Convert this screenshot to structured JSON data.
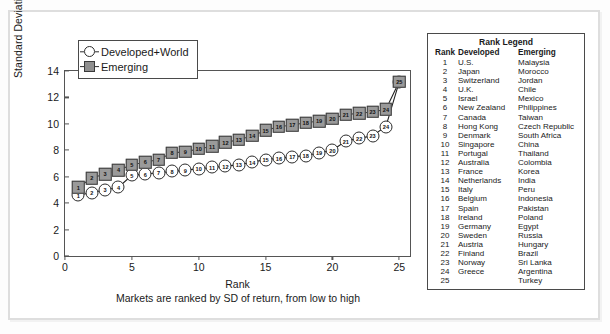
{
  "chart_data": {
    "type": "line",
    "title": "",
    "xlabel": "Rank",
    "xsublabel": "Markets are ranked by SD of return, from low to high",
    "ylabel": "Standard Deviation (%/month)",
    "xlim": [
      0,
      25.8
    ],
    "ylim": [
      0,
      14
    ],
    "yticks": [
      0,
      2,
      4,
      6,
      8,
      10,
      12,
      14
    ],
    "xticks": [
      0,
      5,
      10,
      15,
      20,
      25
    ],
    "grid": false,
    "legend_position": "top-left",
    "x": [
      1,
      2,
      3,
      4,
      5,
      6,
      7,
      8,
      9,
      10,
      11,
      12,
      13,
      14,
      15,
      16,
      17,
      18,
      19,
      20,
      21,
      22,
      23,
      24,
      25
    ],
    "series": [
      {
        "name": "Developed+World",
        "marker": "open-circle",
        "values": [
          4.6,
          4.8,
          5.0,
          5.2,
          6.1,
          6.2,
          6.3,
          6.4,
          6.5,
          6.6,
          6.7,
          6.8,
          6.9,
          7.1,
          7.3,
          7.4,
          7.5,
          7.6,
          7.8,
          8.0,
          8.7,
          8.9,
          9.1,
          9.8,
          13.2
        ]
      },
      {
        "name": "Emerging",
        "marker": "filled-square",
        "values": [
          5.2,
          5.9,
          6.2,
          6.5,
          6.9,
          7.1,
          7.3,
          7.8,
          7.9,
          8.1,
          8.3,
          8.6,
          8.8,
          9.1,
          9.5,
          9.8,
          9.9,
          10.1,
          10.2,
          10.4,
          10.7,
          10.8,
          10.9,
          11.1,
          13.2
        ]
      }
    ]
  },
  "series_legend": {
    "items": [
      {
        "label": "Developed+World",
        "marker": "open-circle"
      },
      {
        "label": "Emerging",
        "marker": "filled-square"
      }
    ]
  },
  "rank_legend": {
    "title": "Rank Legend",
    "columns": [
      "Rank",
      "Developed",
      "Emerging"
    ],
    "rows": [
      {
        "rank": "1",
        "developed": "U.S.",
        "emerging": "Malaysia"
      },
      {
        "rank": "2",
        "developed": "Japan",
        "emerging": "Morocco"
      },
      {
        "rank": "3",
        "developed": "Switzerland",
        "emerging": "Jordan"
      },
      {
        "rank": "4",
        "developed": "U.K.",
        "emerging": "Chile"
      },
      {
        "rank": "5",
        "developed": "Israel",
        "emerging": "Mexico"
      },
      {
        "rank": "6",
        "developed": "New Zealand",
        "emerging": "Philippines"
      },
      {
        "rank": "7",
        "developed": "Canada",
        "emerging": "Taiwan"
      },
      {
        "rank": "8",
        "developed": "Hong Kong",
        "emerging": "Czech Republic"
      },
      {
        "rank": "9",
        "developed": "Denmark",
        "emerging": "South Africa"
      },
      {
        "rank": "10",
        "developed": "Singapore",
        "emerging": "China"
      },
      {
        "rank": "11",
        "developed": "Portugal",
        "emerging": "Thailand"
      },
      {
        "rank": "12",
        "developed": "Australia",
        "emerging": "Colombia"
      },
      {
        "rank": "13",
        "developed": "France",
        "emerging": "Korea"
      },
      {
        "rank": "14",
        "developed": "Netherlands",
        "emerging": "India"
      },
      {
        "rank": "15",
        "developed": "Italy",
        "emerging": "Peru"
      },
      {
        "rank": "16",
        "developed": "Belgium",
        "emerging": "Indonesia"
      },
      {
        "rank": "17",
        "developed": "Spain",
        "emerging": "Pakistan"
      },
      {
        "rank": "18",
        "developed": "Ireland",
        "emerging": "Poland"
      },
      {
        "rank": "19",
        "developed": "Germany",
        "emerging": "Egypt"
      },
      {
        "rank": "20",
        "developed": "Sweden",
        "emerging": "Russia"
      },
      {
        "rank": "21",
        "developed": "Austria",
        "emerging": "Hungary"
      },
      {
        "rank": "22",
        "developed": "Finland",
        "emerging": "Brazil"
      },
      {
        "rank": "23",
        "developed": "Norway",
        "emerging": "Sri Lanka"
      },
      {
        "rank": "24",
        "developed": "Greece",
        "emerging": "Argentina"
      },
      {
        "rank": "25",
        "developed": "",
        "emerging": "Turkey"
      }
    ]
  },
  "colors": {
    "emerging_marker": "#9a9a9a",
    "developed_marker": "#ffffff",
    "line": "#222222",
    "axis": "#555555",
    "frame": "#dedede"
  }
}
